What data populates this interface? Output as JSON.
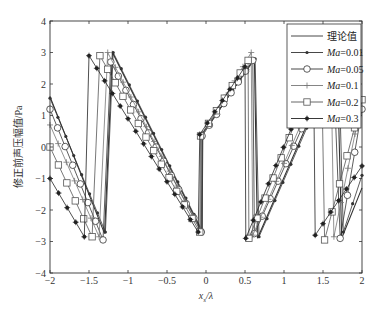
{
  "chart_data": {
    "type": "line",
    "title": "",
    "xlabel": "x_s/λ",
    "xlabel_main": "x",
    "xlabel_sub": "s",
    "xlabel_tail": "/λ",
    "ylabel": "修正前声压幅值/Pa",
    "xlim": [
      -2,
      2
    ],
    "ylim": [
      -4,
      4
    ],
    "xticks": [
      -2,
      -1.5,
      -1,
      -0.5,
      0,
      0.5,
      1,
      1.5,
      2
    ],
    "xtick_labels": [
      "−2",
      "−1.5",
      "−1",
      "−0.5",
      "0",
      "0.5",
      "1",
      "1.5",
      "2"
    ],
    "yticks": [
      -4,
      -3,
      -2,
      -1,
      0,
      1,
      2,
      3,
      4
    ],
    "ytick_labels": [
      "−4",
      "−3",
      "−2",
      "−1",
      "0",
      "1",
      "2",
      "3",
      "4"
    ],
    "grid": false,
    "legend_position": "upper right",
    "series": [
      {
        "name": "理论值",
        "marker": "none",
        "color": "#333333",
        "segments": [
          [
            [
              -2,
              1.6
            ],
            [
              -1.3,
              -2.75
            ]
          ],
          [
            [
              -1.2,
              3.0
            ],
            [
              -0.05,
              -2.7
            ]
          ],
          [
            [
              -0.05,
              0.4
            ],
            [
              0.62,
              2.8
            ]
          ],
          [
            [
              0.66,
              -2.9
            ],
            [
              1.68,
              2.9
            ]
          ],
          [
            [
              1.74,
              -2.9
            ],
            [
              2,
              -1.3
            ]
          ]
        ]
      },
      {
        "name": "Ma=0.01",
        "marker": "dot",
        "color": "#333333",
        "segments": [
          [
            [
              -2,
              1.55
            ],
            [
              -1.29,
              -2.7
            ]
          ],
          [
            [
              -1.19,
              3.0
            ],
            [
              -0.05,
              -2.65
            ]
          ],
          [
            [
              -0.04,
              0.45
            ],
            [
              0.63,
              2.8
            ]
          ],
          [
            [
              0.68,
              -2.85
            ],
            [
              1.7,
              2.9
            ]
          ],
          [
            [
              1.76,
              -2.7
            ],
            [
              2,
              -0.9
            ]
          ]
        ]
      },
      {
        "name": "Ma=0.05",
        "marker": "circle",
        "color": "#333333",
        "segments": [
          [
            [
              -2,
              1.2
            ],
            [
              -1.32,
              -2.95
            ]
          ],
          [
            [
              -1.22,
              2.7
            ],
            [
              -0.06,
              -2.7
            ]
          ],
          [
            [
              -0.05,
              0.35
            ],
            [
              0.6,
              2.75
            ]
          ],
          [
            [
              0.62,
              -2.75
            ],
            [
              1.63,
              2.8
            ]
          ],
          [
            [
              1.72,
              -2.9
            ],
            [
              2,
              1.2
            ]
          ]
        ]
      },
      {
        "name": "Ma=0.1",
        "marker": "plus",
        "color": "#777777",
        "segments": [
          [
            [
              -2,
              0.7
            ],
            [
              -1.37,
              -2.85
            ]
          ],
          [
            [
              -1.26,
              3.0
            ],
            [
              -0.07,
              -2.65
            ]
          ],
          [
            [
              -0.06,
              0.3
            ],
            [
              0.58,
              3.0
            ]
          ],
          [
            [
              0.6,
              -2.8
            ],
            [
              1.6,
              2.9
            ]
          ],
          [
            [
              1.64,
              -2.85
            ],
            [
              2,
              1.5
            ]
          ]
        ]
      },
      {
        "name": "Ma=0.2",
        "marker": "square",
        "color": "#555555",
        "segments": [
          [
            [
              -2,
              0.0
            ],
            [
              -1.46,
              -2.85
            ]
          ],
          [
            [
              -1.36,
              2.9
            ],
            [
              -0.08,
              -2.7
            ]
          ],
          [
            [
              -0.07,
              0.35
            ],
            [
              0.54,
              2.75
            ]
          ],
          [
            [
              0.55,
              -2.9
            ],
            [
              1.48,
              2.85
            ]
          ],
          [
            [
              1.52,
              -2.95
            ],
            [
              2,
              1.5
            ]
          ]
        ]
      },
      {
        "name": "Ma=0.3",
        "marker": "star",
        "color": "#222222",
        "segments": [
          [
            [
              -2,
              -1.0
            ],
            [
              -1.56,
              -2.85
            ]
          ],
          [
            [
              -1.5,
              2.9
            ],
            [
              -0.1,
              -2.7
            ]
          ],
          [
            [
              -0.08,
              0.4
            ],
            [
              0.5,
              2.55
            ]
          ],
          [
            [
              0.51,
              -2.9
            ],
            [
              1.38,
              2.3
            ]
          ],
          [
            [
              1.4,
              -2.8
            ],
            [
              2,
              -0.6
            ]
          ]
        ]
      }
    ]
  },
  "legend": {
    "items": [
      {
        "label_prefix": "",
        "label": "理论值"
      },
      {
        "label_prefix": "Ma",
        "label": "=0.01"
      },
      {
        "label_prefix": "Ma",
        "label": "=0.05"
      },
      {
        "label_prefix": "Ma",
        "label": "=0.1"
      },
      {
        "label_prefix": "Ma",
        "label": "=0.2"
      },
      {
        "label_prefix": "Ma",
        "label": "=0.3"
      }
    ]
  }
}
